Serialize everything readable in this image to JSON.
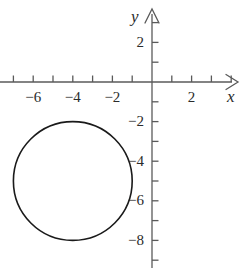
{
  "figure": {
    "title": "",
    "width": 242,
    "height": 268,
    "background_color": "#ffffff",
    "ink_color": "#2b2b2b",
    "curve_color": "#1a1a1a"
  },
  "axes": {
    "x_axis_label": "x",
    "y_axis_label": "y",
    "x_label_name": "x-axis-label",
    "y_label_name": "y-axis-label",
    "origin_px": {
      "x": 152,
      "y": 82
    },
    "unit_px": 19.8,
    "x_range": [
      -7.7,
      4.3
    ],
    "y_range": [
      -9.4,
      3.6
    ],
    "x_ticks_all": [
      -7,
      -6,
      -5,
      -4,
      -3,
      -2,
      -1,
      1,
      2,
      3,
      4
    ],
    "y_ticks_all": [
      3,
      2,
      1,
      -1,
      -2,
      -3,
      -4,
      -5,
      -6,
      -7,
      -8,
      -9
    ],
    "x_tick_labels": [
      {
        "value": -6,
        "text": "−6"
      },
      {
        "value": -4,
        "text": "−4"
      },
      {
        "value": -2,
        "text": "−2"
      },
      {
        "value": 2,
        "text": "2"
      }
    ],
    "y_tick_labels": [
      {
        "value": 2,
        "text": "2"
      },
      {
        "value": -2,
        "text": "−2"
      },
      {
        "value": -4,
        "text": "−4"
      },
      {
        "value": -6,
        "text": "−6"
      },
      {
        "value": -8,
        "text": "−8"
      }
    ],
    "grid": false,
    "arrowheads": [
      "x-positive",
      "y-positive"
    ]
  },
  "chart_data": {
    "type": "line",
    "title": "",
    "xlabel": "x",
    "ylabel": "y",
    "xlim": [
      -7.7,
      4.3
    ],
    "ylim": [
      -9.4,
      3.6
    ],
    "grid": false,
    "legend": null,
    "series": [
      {
        "name": "circle",
        "shape": "circle",
        "center": [
          -4,
          -5
        ],
        "radius": 3,
        "equation": "(x + 4)^2 + (y + 5)^2 = 9",
        "stroke": "#1a1a1a",
        "stroke_width": 1.6,
        "fill": "none",
        "x_intercepts_on_plot": [
          -7,
          -1
        ],
        "y_extent_on_plot": [
          -8,
          -2
        ]
      }
    ],
    "annotations": []
  }
}
